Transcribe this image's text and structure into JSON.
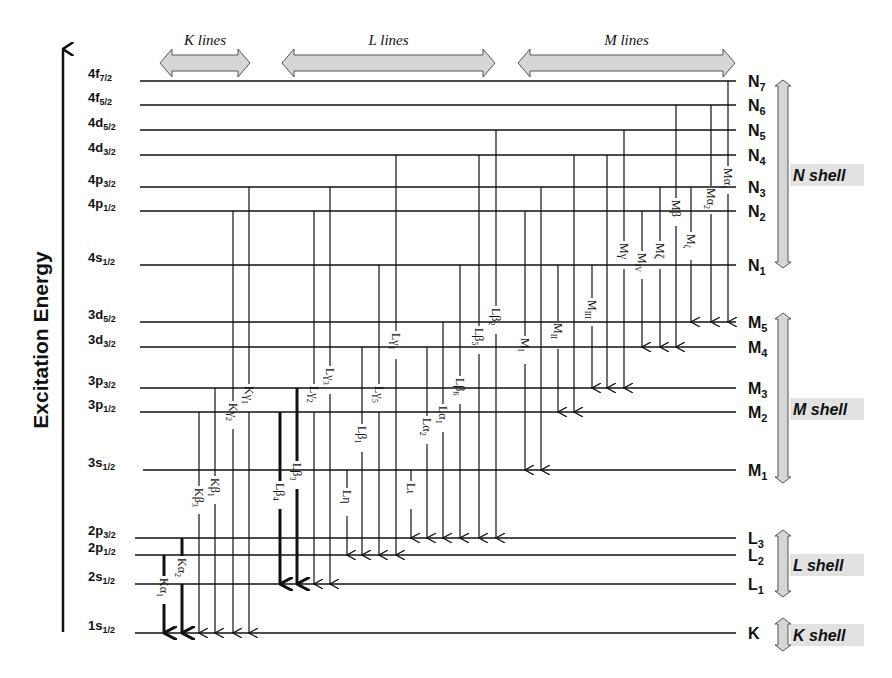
{
  "axis": {
    "title": "Excitation Energy"
  },
  "groups": [
    {
      "label": "K lines",
      "x1": 160,
      "x2": 250
    },
    {
      "label": "L lines",
      "x1": 282,
      "x2": 495
    },
    {
      "label": "M lines",
      "x1": 518,
      "x2": 735
    }
  ],
  "colors": {
    "line": "#111111",
    "arrow_fill": "#d6d6d6",
    "arrow_stroke": "#555555",
    "shell_bg": "#e2e2e2"
  },
  "levels": [
    {
      "id": "4f72",
      "orbital": "4f",
      "sub": "7/2",
      "shell": "N",
      "shell_sub": "7",
      "y": 81,
      "x_start": 140
    },
    {
      "id": "4f52",
      "orbital": "4f",
      "sub": "5/2",
      "shell": "N",
      "shell_sub": "6",
      "y": 105,
      "x_start": 140
    },
    {
      "id": "4d52",
      "orbital": "4d",
      "sub": "5/2",
      "shell": "N",
      "shell_sub": "5",
      "y": 130,
      "x_start": 140
    },
    {
      "id": "4d32",
      "orbital": "4d",
      "sub": "3/2",
      "shell": "N",
      "shell_sub": "4",
      "y": 155,
      "x_start": 140
    },
    {
      "id": "4p32",
      "orbital": "4p",
      "sub": "3/2",
      "shell": "N",
      "shell_sub": "3",
      "y": 187,
      "x_start": 140
    },
    {
      "id": "4p12",
      "orbital": "4p",
      "sub": "1/2",
      "shell": "N",
      "shell_sub": "2",
      "y": 211,
      "x_start": 140
    },
    {
      "id": "4s12",
      "orbital": "4s",
      "sub": "1/2",
      "shell": "N",
      "shell_sub": "1",
      "y": 265,
      "x_start": 140
    },
    {
      "id": "3d52",
      "orbital": "3d",
      "sub": "5/2",
      "shell": "M",
      "shell_sub": "5",
      "y": 322,
      "x_start": 140
    },
    {
      "id": "3d32",
      "orbital": "3d",
      "sub": "3/2",
      "shell": "M",
      "shell_sub": "4",
      "y": 347,
      "x_start": 140
    },
    {
      "id": "3p32",
      "orbital": "3p",
      "sub": "3/2",
      "shell": "M",
      "shell_sub": "3",
      "y": 388,
      "x_start": 140
    },
    {
      "id": "3p12",
      "orbital": "3p",
      "sub": "1/2",
      "shell": "M",
      "shell_sub": "2",
      "y": 412,
      "x_start": 140
    },
    {
      "id": "3s12",
      "orbital": "3s",
      "sub": "1/2",
      "shell": "M",
      "shell_sub": "1",
      "y": 470,
      "x_start": 143
    },
    {
      "id": "2p32",
      "orbital": "2p",
      "sub": "3/2",
      "shell": "L",
      "shell_sub": "3",
      "y": 538,
      "x_start": 135
    },
    {
      "id": "2p12",
      "orbital": "2p",
      "sub": "1/2",
      "shell": "L",
      "shell_sub": "2",
      "y": 555,
      "x_start": 135
    },
    {
      "id": "2s12",
      "orbital": "2s",
      "sub": "1/2",
      "shell": "L",
      "shell_sub": "1",
      "y": 584,
      "x_start": 135
    },
    {
      "id": "1s12",
      "orbital": "1s",
      "sub": "1/2",
      "shell": "K",
      "shell_sub": "",
      "y": 633,
      "x_start": 135
    }
  ],
  "shells": [
    {
      "name": "N shell",
      "y1": 80,
      "y2": 268,
      "label_y": 176
    },
    {
      "name": "M shell",
      "y1": 313,
      "y2": 483,
      "label_y": 410
    },
    {
      "name": "L shell",
      "y1": 530,
      "y2": 597,
      "label_y": 566
    },
    {
      "name": "K shell",
      "y1": 618,
      "y2": 651,
      "label_y": 636
    }
  ],
  "transitions": [
    {
      "label": "Kα",
      "sub": "1",
      "x": 164,
      "from": "2p12",
      "to": "1s12",
      "bold": true,
      "label_y": 600
    },
    {
      "label": "Kα",
      "sub": "2",
      "x": 182,
      "from": "2p32",
      "to": "1s12",
      "bold": true,
      "label_y": 580
    },
    {
      "label": "Kβ",
      "sub": "3",
      "x": 199,
      "from": "3p12",
      "to": "1s12",
      "bold": false,
      "label_y": 510
    },
    {
      "label": "Kβ",
      "sub": "1",
      "x": 215,
      "from": "3p32",
      "to": "1s12",
      "bold": false,
      "label_y": 500
    },
    {
      "label": "Kγ",
      "sub": "2",
      "x": 233,
      "from": "4p12",
      "to": "1s12",
      "bold": false,
      "label_y": 425
    },
    {
      "label": "Kγ",
      "sub": "1",
      "x": 249,
      "from": "4p32",
      "to": "1s12",
      "bold": false,
      "label_y": 408
    },
    {
      "label": "Lβ",
      "sub": "4",
      "x": 280,
      "from": "3p12",
      "to": "2s12",
      "bold": true,
      "label_y": 505
    },
    {
      "label": "Lβ",
      "sub": "3",
      "x": 297,
      "from": "3p32",
      "to": "2s12",
      "bold": true,
      "label_y": 485
    },
    {
      "label": "Lγ",
      "sub": "2",
      "x": 314,
      "from": "4p12",
      "to": "2s12",
      "bold": false,
      "label_y": 408
    },
    {
      "label": "Lγ",
      "sub": "3",
      "x": 330,
      "from": "4p32",
      "to": "2s12",
      "bold": false,
      "label_y": 390
    },
    {
      "label": "Lη",
      "sub": "",
      "x": 347,
      "from": "3s12",
      "to": "2p12",
      "bold": false,
      "label_y": 512
    },
    {
      "label": "Lβ",
      "sub": "1",
      "x": 362,
      "from": "3d32",
      "to": "2p12",
      "bold": false,
      "label_y": 448
    },
    {
      "label": "Lγ",
      "sub": "5",
      "x": 379,
      "from": "4s12",
      "to": "2p12",
      "bold": false,
      "label_y": 408
    },
    {
      "label": "Lγ",
      "sub": "1",
      "x": 396,
      "from": "4d32",
      "to": "2p12",
      "bold": false,
      "label_y": 355
    },
    {
      "label": "Lι",
      "sub": "",
      "x": 411,
      "from": "3s12",
      "to": "2p32",
      "bold": false,
      "label_y": 505
    },
    {
      "label": "Lα",
      "sub": "2",
      "x": 427,
      "from": "3d32",
      "to": "2p32",
      "bold": false,
      "label_y": 440
    },
    {
      "label": "Lα",
      "sub": "1",
      "x": 443,
      "from": "3d52",
      "to": "2p32",
      "bold": false,
      "label_y": 428
    },
    {
      "label": "Lβ",
      "sub": "6",
      "x": 460,
      "from": "4s12",
      "to": "2p32",
      "bold": false,
      "label_y": 400
    },
    {
      "label": "Lβ",
      "sub": "5",
      "x": 479,
      "from": "4d32",
      "to": "2p32",
      "bold": false,
      "label_y": 350
    },
    {
      "label": "Lβ",
      "sub": "2",
      "x": 496,
      "from": "4d52",
      "to": "2p32",
      "bold": false,
      "label_y": 330
    },
    {
      "label": "M",
      "sub": "I",
      "x": 525,
      "from": "4p12",
      "to": "3s12",
      "bold": false,
      "label_y": 360
    },
    {
      "label": "",
      "sub": "",
      "x": 541,
      "from": "4p32",
      "to": "3s12",
      "bold": false,
      "label_y": 0
    },
    {
      "label": "M",
      "sub": "II",
      "x": 558,
      "from": "4s12",
      "to": "3p12",
      "bold": false,
      "label_y": 345
    },
    {
      "label": "",
      "sub": "",
      "x": 574,
      "from": "4d32",
      "to": "3p12",
      "bold": false,
      "label_y": 0
    },
    {
      "label": "M",
      "sub": "III",
      "x": 592,
      "from": "4s12",
      "to": "3p32",
      "bold": false,
      "label_y": 322
    },
    {
      "label": "",
      "sub": "",
      "x": 607,
      "from": "4d32",
      "to": "3p32",
      "bold": false,
      "label_y": 0
    },
    {
      "label": "Mγ",
      "sub": "",
      "x": 624,
      "from": "4d52",
      "to": "3p32",
      "bold": false,
      "label_y": 265
    },
    {
      "label": "M",
      "sub": "IV",
      "x": 642,
      "from": "4p12",
      "to": "3d32",
      "bold": false,
      "label_y": 275
    },
    {
      "label": "Mζ",
      "sub": "",
      "x": 660,
      "from": "4p32",
      "to": "3d32",
      "bold": false,
      "label_y": 265
    },
    {
      "label": "Mβ",
      "sub": "",
      "x": 676,
      "from": "4f52",
      "to": "3d32",
      "bold": false,
      "label_y": 222
    },
    {
      "label": "M",
      "sub": "ζ",
      "x": 691,
      "from": "4p32",
      "to": "3d52",
      "bold": false,
      "label_y": 256
    },
    {
      "label": "Mα",
      "sub": "2",
      "x": 711,
      "from": "4f52",
      "to": "3d52",
      "bold": false,
      "label_y": 210
    },
    {
      "label": "Mα",
      "sub": "1",
      "x": 728,
      "from": "4f72",
      "to": "3d52",
      "bold": false,
      "label_y": 190
    }
  ]
}
